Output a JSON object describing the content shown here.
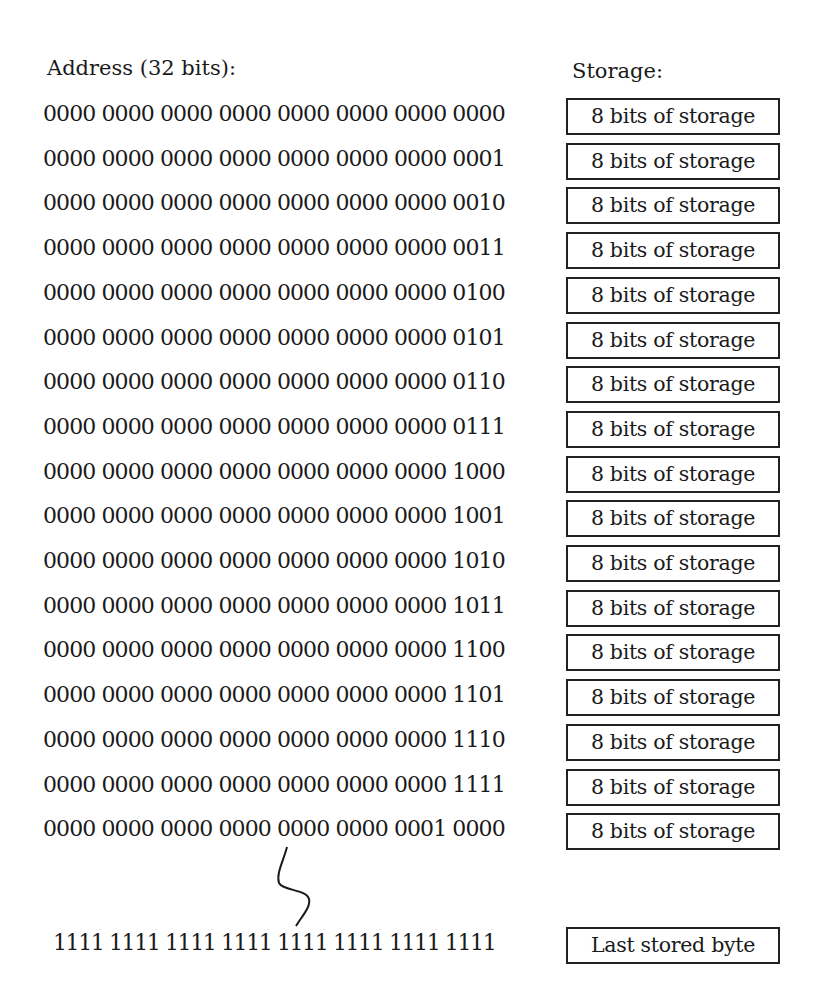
{
  "headers": {
    "address": "Address (32 bits):",
    "storage": "Storage:"
  },
  "rows": [
    {
      "address": "0000 0000 0000 0000 0000 0000 0000 0000",
      "storage": "8 bits of storage"
    },
    {
      "address": "0000 0000 0000 0000 0000 0000 0000 0001",
      "storage": "8 bits of storage"
    },
    {
      "address": "0000 0000 0000 0000 0000 0000 0000 0010",
      "storage": "8 bits of storage"
    },
    {
      "address": "0000 0000 0000 0000 0000 0000 0000 0011",
      "storage": "8 bits of storage"
    },
    {
      "address": "0000 0000 0000 0000 0000 0000 0000 0100",
      "storage": "8 bits of storage"
    },
    {
      "address": "0000 0000 0000 0000 0000 0000 0000 0101",
      "storage": "8 bits of storage"
    },
    {
      "address": "0000 0000 0000 0000 0000 0000 0000 0110",
      "storage": "8 bits of storage"
    },
    {
      "address": "0000 0000 0000 0000 0000 0000 0000 0111",
      "storage": "8 bits of storage"
    },
    {
      "address": "0000 0000 0000 0000 0000 0000 0000 1000",
      "storage": "8 bits of storage"
    },
    {
      "address": "0000 0000 0000 0000 0000 0000 0000 1001",
      "storage": "8 bits of storage"
    },
    {
      "address": "0000 0000 0000 0000 0000 0000 0000 1010",
      "storage": "8 bits of storage"
    },
    {
      "address": "0000 0000 0000 0000 0000 0000 0000 1011",
      "storage": "8 bits of storage"
    },
    {
      "address": "0000 0000 0000 0000 0000 0000 0000 1100",
      "storage": "8 bits of storage"
    },
    {
      "address": "0000 0000 0000 0000 0000 0000 0000 1101",
      "storage": "8 bits of storage"
    },
    {
      "address": "0000 0000 0000 0000 0000 0000 0000 1110",
      "storage": "8 bits of storage"
    },
    {
      "address": "0000 0000 0000 0000 0000 0000 0000 1111",
      "storage": "8 bits of storage"
    },
    {
      "address": "0000 0000 0000 0000 0000 0000 0001 0000",
      "storage": "8 bits of storage"
    }
  ],
  "last": {
    "address": "1111 1111 1111 1111 1111 1111 1111 1111",
    "storage": "Last stored byte"
  },
  "colors": {
    "text": "#1a1a1a",
    "border": "#222222",
    "background": "#ffffff"
  }
}
